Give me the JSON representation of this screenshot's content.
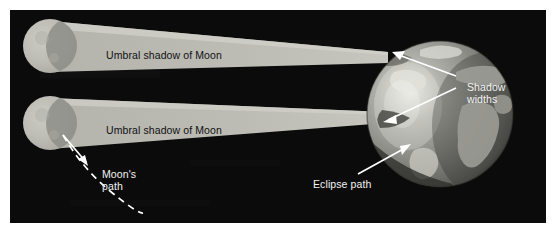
{
  "figure": {
    "width": 556,
    "height": 233,
    "background": "#ffffff",
    "panel_background": "#0b0b0b",
    "panel": {
      "x": 10,
      "y": 10,
      "width": 536,
      "height": 213
    }
  },
  "colors": {
    "space": "#0b0b0b",
    "shadow_band": "#b9b9b2",
    "shadow_band_edge": "#cfcfc8",
    "moon_body": "#bdbdb6",
    "moon_shading": "#8e8e88",
    "earth_ocean": "#7d7d78",
    "earth_land": "#c9c9c2",
    "earth_highlight": "#e8e8e2",
    "earth_dark_limb": "#3a3a38",
    "text_dark": "#111111",
    "text_light": "#f2f2f2",
    "arrow_white": "#ffffff"
  },
  "labels": {
    "umbral_shadow_top": "Umbral shadow of Moon",
    "umbral_shadow_bottom": "Umbral shadow of Moon",
    "shadow_widths": "Shadow\nwidths",
    "moons_path": "Moon's\npath",
    "eclipse_path": "Eclipse path"
  },
  "diagram": {
    "type": "astronomy-schematic",
    "moons": [
      {
        "name": "moon-upper",
        "cx": 50,
        "cy": 46,
        "r": 27
      },
      {
        "name": "moon-lower",
        "cx": 50,
        "cy": 123,
        "r": 27
      }
    ],
    "shadow_cones": [
      {
        "name": "umbral-cone-upper",
        "from": {
          "x": 50,
          "y": 46
        },
        "to_earth": {
          "x": 388,
          "y": 57
        },
        "near_half_width": 25,
        "far_half_width": 5
      },
      {
        "name": "umbral-cone-lower",
        "from": {
          "x": 50,
          "y": 123
        },
        "to_earth": {
          "x": 386,
          "y": 118
        },
        "near_half_width": 25,
        "far_half_width": 6
      }
    ],
    "earth": {
      "name": "earth-globe",
      "cx": 440,
      "cy": 114,
      "r": 73,
      "terminator_highlight": {
        "cx": 404,
        "cy": 102
      }
    },
    "arrows": [
      {
        "name": "shadow-width-arrow-upper",
        "from": {
          "x": 452,
          "y": 73
        },
        "to": {
          "x": 392,
          "y": 52
        }
      },
      {
        "name": "shadow-width-arrow-lower",
        "from": {
          "x": 452,
          "y": 86
        },
        "to": {
          "x": 383,
          "y": 120
        }
      },
      {
        "name": "eclipse-path-arrow",
        "from": {
          "x": 360,
          "y": 172
        },
        "to": {
          "x": 406,
          "y": 146
        }
      },
      {
        "name": "moons-path-arrow",
        "from": {
          "x": 63,
          "y": 135
        },
        "to": {
          "x": 85,
          "y": 163
        }
      }
    ],
    "moons_path_curve": {
      "name": "moons-path-dashed-curve",
      "style": "dashed",
      "color": "#ffffff",
      "points": [
        [
          63,
          135
        ],
        [
          90,
          170
        ],
        [
          112,
          193
        ],
        [
          140,
          212
        ]
      ]
    }
  }
}
